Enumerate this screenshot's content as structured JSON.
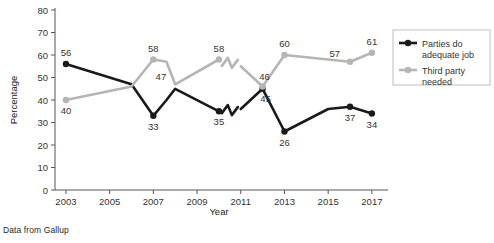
{
  "source_note": "Data from Gallup",
  "axes": {
    "xlabel": "Year",
    "ylabel": "Percentage",
    "x_ticks": [
      "2003",
      "2005",
      "2007",
      "2009",
      "2011",
      "2013",
      "2015",
      "2017"
    ],
    "y_ticks": [
      "0",
      "10",
      "20",
      "30",
      "40",
      "50",
      "60",
      "70",
      "80"
    ]
  },
  "legend": {
    "items": [
      {
        "label_line1": "Parties do",
        "label_line2": "adequate job",
        "color": "#1a1a1a",
        "name": "legend-parties-do-adequate-job"
      },
      {
        "label_line1": "Third party",
        "label_line2": "needed",
        "color": "#b5b5b5",
        "name": "legend-third-party-needed"
      }
    ]
  },
  "chart_data": {
    "type": "line",
    "title": "",
    "xlabel": "Year",
    "ylabel": "Percentage",
    "xlim": [
      2002.5,
      2017.6
    ],
    "ylim": [
      0,
      80
    ],
    "ytick_step": 10,
    "grid": false,
    "legend_position": "right",
    "annotations": [
      "Data from Gallup"
    ],
    "series": [
      {
        "name": "Parties do adequate job",
        "color": "#1a1a1a",
        "points": [
          {
            "x": 2003,
            "y": 56,
            "label": "56",
            "label_pos": "above",
            "marker": true
          },
          {
            "x": 2006,
            "y": 47,
            "label": "",
            "label_pos": "",
            "marker": false
          },
          {
            "x": 2007,
            "y": 33,
            "label": "33",
            "label_pos": "below",
            "marker": true
          },
          {
            "x": 2007.6,
            "y": 40,
            "label": "",
            "label_pos": "",
            "marker": false
          },
          {
            "x": 2008,
            "y": 45,
            "label": "",
            "label_pos": "",
            "marker": false
          },
          {
            "x": 2010,
            "y": 35,
            "label": "35",
            "label_pos": "below",
            "marker": true
          },
          {
            "x": 2011,
            "y": 36,
            "label": "",
            "label_pos": "",
            "marker": false
          },
          {
            "x": 2012,
            "y": 45,
            "label": "45",
            "label_pos": "below-right",
            "marker": true
          },
          {
            "x": 2013,
            "y": 26,
            "label": "26",
            "label_pos": "below",
            "marker": true
          },
          {
            "x": 2015,
            "y": 36,
            "label": "",
            "label_pos": "",
            "marker": false
          },
          {
            "x": 2016,
            "y": 37,
            "label": "37",
            "label_pos": "below",
            "marker": true
          },
          {
            "x": 2017,
            "y": 34,
            "label": "34",
            "label_pos": "below",
            "marker": true
          }
        ],
        "break_between": [
          [
            2010,
            2011
          ]
        ]
      },
      {
        "name": "Third party needed",
        "color": "#b5b5b5",
        "points": [
          {
            "x": 2003,
            "y": 40,
            "label": "40",
            "label_pos": "below",
            "marker": true
          },
          {
            "x": 2006,
            "y": 46,
            "label": "",
            "label_pos": "",
            "marker": false
          },
          {
            "x": 2007,
            "y": 58,
            "label": "58",
            "label_pos": "above",
            "marker": true
          },
          {
            "x": 2007.6,
            "y": 57,
            "label": "",
            "label_pos": "",
            "marker": false
          },
          {
            "x": 2008,
            "y": 47,
            "label": "47",
            "label_pos": "left-above",
            "marker": false
          },
          {
            "x": 2010,
            "y": 58,
            "label": "58",
            "label_pos": "above",
            "marker": true
          },
          {
            "x": 2011,
            "y": 55,
            "label": "",
            "label_pos": "",
            "marker": false
          },
          {
            "x": 2012,
            "y": 46,
            "label": "46",
            "label_pos": "above-right",
            "marker": true
          },
          {
            "x": 2013,
            "y": 60,
            "label": "60",
            "label_pos": "above",
            "marker": true
          },
          {
            "x": 2015,
            "y": 58,
            "label": "",
            "label_pos": "",
            "marker": false
          },
          {
            "x": 2016,
            "y": 57,
            "label": "57",
            "label_pos": "above-left",
            "marker": true
          },
          {
            "x": 2017,
            "y": 61,
            "label": "61",
            "label_pos": "above",
            "marker": true
          }
        ],
        "break_between": [
          [
            2010,
            2011
          ]
        ]
      }
    ]
  }
}
